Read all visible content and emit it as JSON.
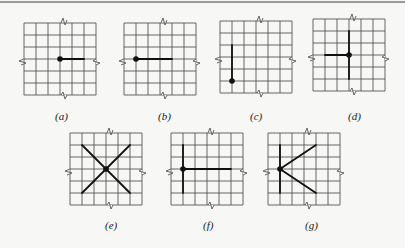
{
  "figure": {
    "grid": {
      "cells": 6,
      "cell_px": 12,
      "line_color": "#555555",
      "stroke_color": "#111111"
    },
    "panels": [
      {
        "id": "a",
        "label": "(a)",
        "x": 24,
        "y": 23,
        "label_x": 55,
        "label_y": 110,
        "dot": [
          3,
          3
        ],
        "segments": [
          [
            [
              3,
              3
            ],
            [
              5,
              3
            ]
          ]
        ]
      },
      {
        "id": "b",
        "label": "(b)",
        "x": 124,
        "y": 23,
        "label_x": 158,
        "label_y": 110,
        "dot": [
          1,
          3
        ],
        "segments": [
          [
            [
              1,
              3
            ],
            [
              4,
              3
            ]
          ]
        ]
      },
      {
        "id": "c",
        "label": "(c)",
        "x": 220,
        "y": 21,
        "label_x": 250,
        "label_y": 110,
        "dot": [
          1,
          5
        ],
        "segments": [
          [
            [
              1,
              2
            ],
            [
              1,
              5
            ]
          ]
        ]
      },
      {
        "id": "d",
        "label": "(d)",
        "x": 313,
        "y": 19,
        "label_x": 348,
        "label_y": 110,
        "dot": [
          3,
          3
        ],
        "segments": [
          [
            [
              1,
              3
            ],
            [
              3,
              3
            ]
          ],
          [
            [
              3,
              1
            ],
            [
              3,
              5
            ]
          ]
        ]
      },
      {
        "id": "e",
        "label": "(e)",
        "x": 70,
        "y": 133,
        "label_x": 105,
        "label_y": 219,
        "dot": [
          3,
          3
        ],
        "segments": [
          [
            [
              1,
              1
            ],
            [
              5,
              5
            ]
          ],
          [
            [
              5,
              1
            ],
            [
              1,
              5
            ]
          ]
        ]
      },
      {
        "id": "f",
        "label": "(f)",
        "x": 171,
        "y": 133,
        "label_x": 203,
        "label_y": 219,
        "dot": [
          1,
          3
        ],
        "segments": [
          [
            [
              1,
              1
            ],
            [
              1,
              5
            ]
          ],
          [
            [
              1,
              3
            ],
            [
              5,
              3
            ]
          ]
        ]
      },
      {
        "id": "g",
        "label": "(g)",
        "x": 268,
        "y": 133,
        "label_x": 305,
        "label_y": 219,
        "dot": [
          1,
          3
        ],
        "segments": [
          [
            [
              1,
              1
            ],
            [
              1,
              5
            ]
          ],
          [
            [
              1,
              3
            ],
            [
              4,
              1
            ]
          ],
          [
            [
              1,
              3
            ],
            [
              4,
              5
            ]
          ]
        ]
      }
    ]
  }
}
